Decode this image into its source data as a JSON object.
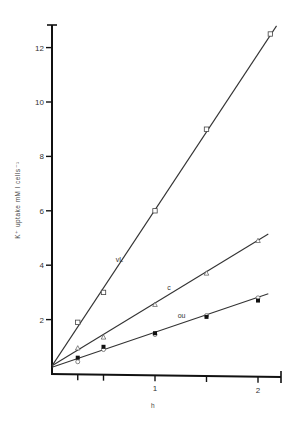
{
  "chart_data": {
    "type": "line",
    "title": "",
    "xlabel": "h",
    "ylabel": "K⁺ uptake  mM l  cells⁻¹",
    "xlim": [
      0,
      2.25
    ],
    "ylim": [
      0,
      13
    ],
    "x_ticks": [
      0.25,
      0.5,
      1,
      1.5,
      2
    ],
    "x_tick_labels": [
      "",
      "",
      "1",
      "",
      "2"
    ],
    "y_ticks": [
      2,
      4,
      6,
      8,
      10,
      12
    ],
    "y_tick_labels": [
      "2",
      "4",
      "6",
      "8",
      "10",
      "12"
    ],
    "grid": false,
    "legend": "inline labels",
    "series": [
      {
        "name": "vL",
        "marker": "open-square",
        "x": [
          0.25,
          0.5,
          1.0,
          1.5,
          2.12
        ],
        "y": [
          1.9,
          3.0,
          6.0,
          9.0,
          12.5
        ],
        "fit_line": {
          "x0": 0,
          "y0": 0.3,
          "x1": 2.18,
          "y1": 12.8
        },
        "label_pos": {
          "x": 0.62,
          "y": 4.1
        }
      },
      {
        "name": "c",
        "marker": "open-triangle",
        "x": [
          0.25,
          0.5,
          1.0,
          1.5,
          2.0
        ],
        "y": [
          0.95,
          1.35,
          2.55,
          3.7,
          4.9
        ],
        "fit_line": {
          "x0": 0,
          "y0": 0.3,
          "x1": 2.1,
          "y1": 5.15
        },
        "label_pos": {
          "x": 1.12,
          "y": 3.1
        }
      },
      {
        "name": "ou",
        "marker": "open-circle",
        "x": [
          0.25,
          0.5,
          1.0,
          1.5,
          2.0
        ],
        "y": [
          0.45,
          0.9,
          1.45,
          2.15,
          2.8
        ],
        "fit_line": {
          "x0": 0,
          "y0": 0.25,
          "x1": 2.1,
          "y1": 2.95
        },
        "label_pos": {
          "x": 1.22,
          "y": 2.05
        }
      },
      {
        "name": "ou (filled)",
        "marker": "filled-square",
        "x": [
          0.25,
          0.5,
          1.0,
          1.5,
          2.0
        ],
        "y": [
          0.6,
          1.0,
          1.5,
          2.1,
          2.7
        ]
      }
    ]
  }
}
